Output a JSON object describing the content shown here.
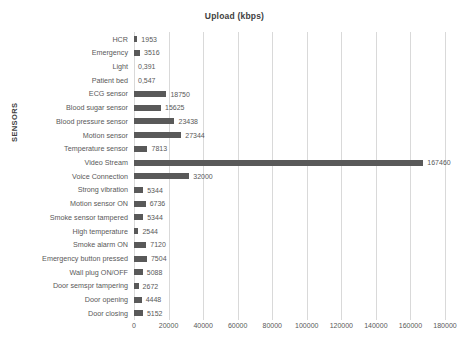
{
  "chart_data": {
    "type": "bar",
    "orientation": "horizontal",
    "title": "Upload (kbps)",
    "xlabel": "",
    "ylabel": "SENSORS",
    "xlim": [
      0,
      180000
    ],
    "xticks": [
      "0",
      "20000",
      "40000",
      "60000",
      "80000",
      "100000",
      "120000",
      "140000",
      "160000",
      "180000"
    ],
    "xtick_values": [
      0,
      20000,
      40000,
      60000,
      80000,
      100000,
      120000,
      140000,
      160000,
      180000
    ],
    "grid": true,
    "legend": false,
    "bar_color": "#595959",
    "gridline_color": "#d9d9d9",
    "categories": [
      "HCR",
      "Emergency",
      "Light",
      "Patient bed",
      "ECG sensor",
      "Blood sugar sensor",
      "Blood pressure sensor",
      "Motion sensor",
      "Temperature sensor",
      "Video Stream",
      "Voice Connection",
      "Strong vibration",
      "Motion sensor ON",
      "Smoke sensor tampered",
      "High temperature",
      "Smoke alarm ON",
      "Emergency button pressed",
      "Wall plug ON/OFF",
      "Door semspr tampering",
      "Door opening",
      "Door closing"
    ],
    "values": [
      1953,
      3516,
      0.391,
      0.547,
      18750,
      15625,
      23438,
      27344,
      7813,
      167460,
      32000,
      5344,
      6736,
      5344,
      2544,
      7120,
      7504,
      5088,
      2672,
      4448,
      5152
    ],
    "value_labels": [
      "1953",
      "3516",
      "0,391",
      "0,547",
      "18750",
      "15625",
      "23438",
      "27344",
      "7813",
      "167460",
      "32000",
      "5344",
      "6736",
      "5344",
      "2544",
      "7120",
      "7504",
      "5088",
      "2672",
      "4448",
      "5152"
    ]
  }
}
